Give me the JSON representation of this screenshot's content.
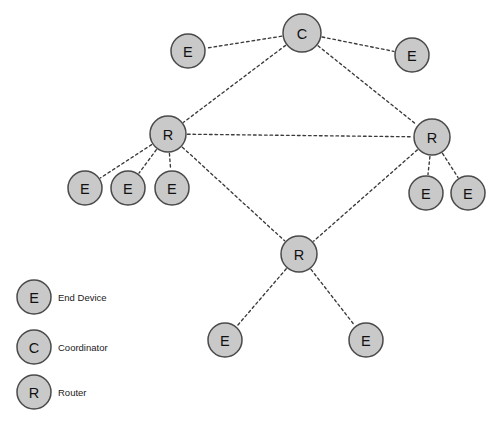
{
  "diagram": {
    "type": "network-topology",
    "background_color": "#ffffff",
    "node_fill_color": "#c9c9c9",
    "node_stroke_color": "#4a4a4a",
    "edge_color": "#3a3a3a",
    "edge_style": "dashed",
    "canvas": {
      "width": 496,
      "height": 427
    }
  },
  "nodes": [
    {
      "id": "c1",
      "label": "C",
      "role": "Coordinator",
      "x": 302,
      "y": 33,
      "r": 19
    },
    {
      "id": "e1",
      "label": "E",
      "role": "End Device",
      "x": 188,
      "y": 51,
      "r": 17
    },
    {
      "id": "e2",
      "label": "E",
      "role": "End Device",
      "x": 412,
      "y": 55,
      "r": 17
    },
    {
      "id": "r1",
      "label": "R",
      "role": "Router",
      "x": 168,
      "y": 134,
      "r": 18
    },
    {
      "id": "r2",
      "label": "R",
      "role": "Router",
      "x": 432,
      "y": 137,
      "r": 18
    },
    {
      "id": "e3",
      "label": "E",
      "role": "End Device",
      "x": 85,
      "y": 188,
      "r": 17
    },
    {
      "id": "e4",
      "label": "E",
      "role": "End Device",
      "x": 128,
      "y": 188,
      "r": 17
    },
    {
      "id": "e5",
      "label": "E",
      "role": "End Device",
      "x": 172,
      "y": 188,
      "r": 17
    },
    {
      "id": "e6",
      "label": "E",
      "role": "End Device",
      "x": 426,
      "y": 193,
      "r": 17
    },
    {
      "id": "e7",
      "label": "E",
      "role": "End Device",
      "x": 468,
      "y": 193,
      "r": 17
    },
    {
      "id": "r3",
      "label": "R",
      "role": "Router",
      "x": 299,
      "y": 254,
      "r": 18
    },
    {
      "id": "e8",
      "label": "E",
      "role": "End Device",
      "x": 225,
      "y": 340,
      "r": 17
    },
    {
      "id": "e9",
      "label": "E",
      "role": "End Device",
      "x": 366,
      "y": 340,
      "r": 17
    }
  ],
  "edges": [
    {
      "from": "c1",
      "to": "e1"
    },
    {
      "from": "c1",
      "to": "e2"
    },
    {
      "from": "c1",
      "to": "r1"
    },
    {
      "from": "c1",
      "to": "r2"
    },
    {
      "from": "r1",
      "to": "r2"
    },
    {
      "from": "r1",
      "to": "e3"
    },
    {
      "from": "r1",
      "to": "e4"
    },
    {
      "from": "r1",
      "to": "e5"
    },
    {
      "from": "r1",
      "to": "r3"
    },
    {
      "from": "r2",
      "to": "e6"
    },
    {
      "from": "r2",
      "to": "e7"
    },
    {
      "from": "r2",
      "to": "r3"
    },
    {
      "from": "r3",
      "to": "e8"
    },
    {
      "from": "r3",
      "to": "e9"
    }
  ],
  "legend": {
    "items": [
      {
        "symbol": "E",
        "label": "End Device",
        "x": 34,
        "y": 297,
        "r": 17,
        "text_x": 58
      },
      {
        "symbol": "C",
        "label": "Coordinator",
        "x": 34,
        "y": 347,
        "r": 17,
        "text_x": 58
      },
      {
        "symbol": "R",
        "label": "Router",
        "x": 34,
        "y": 392,
        "r": 17,
        "text_x": 58
      }
    ]
  }
}
